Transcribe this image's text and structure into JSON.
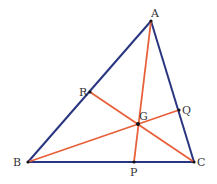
{
  "diagram": {
    "colors": {
      "sides": "#2a3580",
      "medians": "#e8603a",
      "points": "#111111",
      "labels": "#333333"
    },
    "vertices": {
      "A": {
        "label": "A",
        "x": 151,
        "y": 21
      },
      "B": {
        "label": "B",
        "x": 28,
        "y": 162
      },
      "C": {
        "label": "C",
        "x": 194,
        "y": 162
      }
    },
    "midpoints": {
      "P": {
        "label": "P",
        "x": 134,
        "y": 162
      },
      "Q": {
        "label": "Q",
        "x": 179,
        "y": 110
      },
      "R": {
        "label": "R",
        "x": 90,
        "y": 92
      }
    },
    "centroid": {
      "label": "G",
      "x": 138,
      "y": 124
    },
    "sides": [
      [
        "A",
        "B"
      ],
      [
        "B",
        "C"
      ],
      [
        "C",
        "A"
      ]
    ],
    "medians": [
      [
        "A",
        "P"
      ],
      [
        "B",
        "Q"
      ],
      [
        "C",
        "R"
      ]
    ]
  }
}
